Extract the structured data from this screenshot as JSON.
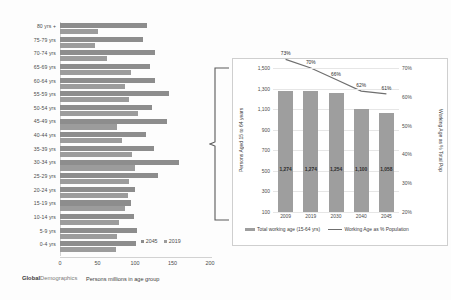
{
  "chart_data": [
    {
      "id": "age-group-bars",
      "type": "bar",
      "orientation": "horizontal",
      "title": "",
      "xlabel": "Persons millions in age group",
      "ylabel": "",
      "xlim": [
        0,
        200
      ],
      "xticks": [
        "0",
        "50",
        "100",
        "150",
        "200"
      ],
      "grid": false,
      "legend_position": "bottom-right",
      "brand_primary": "Global",
      "brand_secondary": "Demographics",
      "colors": {
        "series_2045": "#8d8d8d",
        "series_2019": "#9c9c9c"
      },
      "categories": [
        "80 yrs +",
        "75-79 yrs",
        "70-74 yrs",
        "65-69 yrs",
        "60-64 yrs",
        "55-59 yrs",
        "50-54 yrs",
        "45-49 yrs",
        "40-44 yrs",
        "35-39 yrs",
        "30-34 yrs",
        "25-29 yrs",
        "20-24 yrs",
        "15-19 yrs",
        "10-14 yrs",
        "5-9 yrs",
        "0-4 yrs"
      ],
      "series": [
        {
          "name": "2045",
          "values": [
            116,
            110,
            127,
            120,
            127,
            145,
            122,
            143,
            114,
            125,
            158,
            131,
            100,
            94,
            99,
            102,
            101
          ]
        },
        {
          "name": "2019",
          "values": [
            51,
            46,
            62,
            95,
            87,
            92,
            104,
            76,
            82,
            96,
            100,
            92,
            91,
            86,
            78,
            76,
            75
          ]
        }
      ]
    },
    {
      "id": "working-age-combo",
      "type": "bar",
      "combo": "line",
      "title": "",
      "xlabel": "",
      "ylabel": "Persons Aged 15 to 64 years",
      "y2label": "Working Age as % Total Pop",
      "categories": [
        "2009",
        "2019",
        "2030",
        "2040",
        "2045"
      ],
      "ylim": [
        100,
        1500
      ],
      "yticks": [
        "1,500",
        "1,300",
        "1,100",
        "900",
        "700",
        "500",
        "300",
        "100"
      ],
      "y2lim": [
        20,
        70
      ],
      "y2ticks": [
        "70%",
        "60%",
        "50%",
        "40%",
        "30%",
        "20%"
      ],
      "grid": true,
      "legend_position": "bottom",
      "colors": {
        "bars": "#9e9e9e",
        "line": "#6f6f6f"
      },
      "series": [
        {
          "name": "Total working age (15-64 yrs)",
          "kind": "bar",
          "values": [
            1274,
            1274,
            1254,
            1100,
            1058
          ],
          "labels": [
            "1,274",
            "1,274",
            "1,254",
            "1,100",
            "1,058"
          ]
        },
        {
          "name": "Working Age as % Population",
          "kind": "line",
          "values": [
            73,
            70,
            66,
            62,
            61
          ],
          "labels": [
            "73%",
            "70%",
            "66%",
            "62%",
            "61%"
          ]
        }
      ]
    }
  ],
  "left_chart": {
    "xtitle": "Persons millions in age group",
    "brand_primary": "Global",
    "brand_secondary": "Demographics",
    "legend": [
      {
        "label": "2045"
      },
      {
        "label": "2019"
      }
    ]
  },
  "right_chart": {
    "ytitle": "Persons Aged 15 to 64 years",
    "y2title": "Working Age as % Total Pop",
    "legend": [
      {
        "label": "Total working age (15-64 yrs)"
      },
      {
        "label": "Working Age as % Population"
      }
    ]
  },
  "bracket": {
    "label": "working-age-bracket"
  }
}
